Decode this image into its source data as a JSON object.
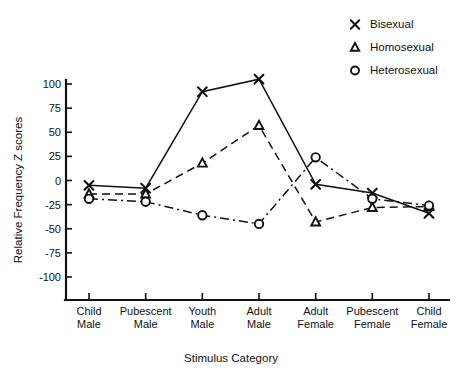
{
  "chart_data": {
    "type": "line",
    "title": "",
    "xlabel": "Stimulus Category",
    "ylabel": "Relative Frequency  Z scores",
    "ylim": [
      -110,
      112
    ],
    "yticks": [
      100,
      75,
      50,
      25,
      0,
      -25,
      -50,
      -75,
      -100
    ],
    "ytick_labels": [
      "100",
      "75",
      "50",
      "25",
      "0",
      "-25",
      "-50",
      "-75",
      "-100"
    ],
    "grid": false,
    "legend_position": "top-right",
    "categories": [
      "Child Male",
      "Pubescent Male",
      "Youth Male",
      "Adult Male",
      "Adult Female",
      "Pubescent Female",
      "Child Female"
    ],
    "category_lines": [
      [
        "Child",
        "Male"
      ],
      [
        "Pubescent",
        "Male"
      ],
      [
        "Youth",
        "Male"
      ],
      [
        "Adult",
        "Male"
      ],
      [
        "Adult",
        "Female"
      ],
      [
        "Pubescent",
        "Female"
      ],
      [
        "Child",
        "Female"
      ]
    ],
    "series": [
      {
        "name": "Bisexual",
        "marker": "x",
        "linestyle": "solid",
        "values": [
          -5,
          -8,
          92,
          105,
          -4,
          -13,
          -34
        ]
      },
      {
        "name": "Homosexual",
        "marker": "triangle",
        "linestyle": "dashed",
        "values": [
          -14,
          -14,
          18,
          57,
          -43,
          -28,
          -27
        ]
      },
      {
        "name": "Heterosexual",
        "marker": "circle",
        "linestyle": "dashdot",
        "values": [
          -19,
          -22,
          -36,
          -45,
          24,
          -19,
          -26
        ]
      }
    ]
  },
  "legend": {
    "items": [
      {
        "label": "Bisexual",
        "marker": "x"
      },
      {
        "label": "Homosexual",
        "marker": "triangle"
      },
      {
        "label": "Heterosexual",
        "marker": "circle"
      }
    ]
  },
  "axes": {
    "y_title": "Relative Frequency  Z scores",
    "x_title": "Stimulus Category"
  }
}
